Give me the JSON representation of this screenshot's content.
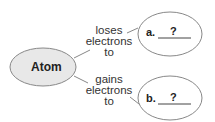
{
  "diagram": {
    "center_node": {
      "label": "Atom",
      "fill": "#e8e8e8"
    },
    "edges": [
      {
        "label_lines": [
          "loses",
          "electrons",
          "to"
        ]
      },
      {
        "label_lines": [
          "gains",
          "electrons",
          "to"
        ]
      }
    ],
    "targets": [
      {
        "prefix": "a.",
        "blank": "?"
      },
      {
        "prefix": "b.",
        "blank": "?"
      }
    ]
  }
}
